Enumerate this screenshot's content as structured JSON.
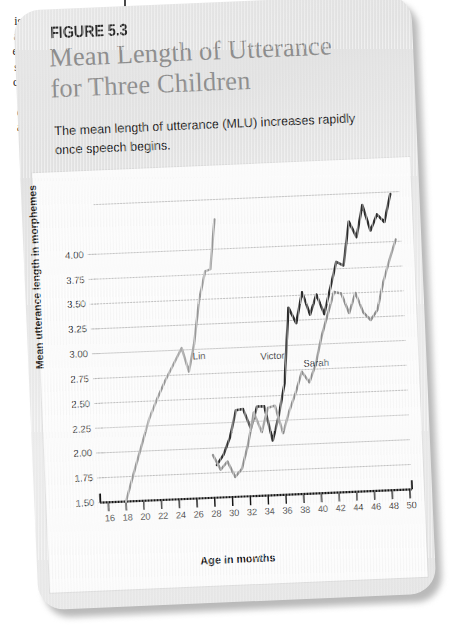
{
  "margin_fragments": [
    "is",
    "at",
    "es",
    "s;",
    "c-",
    "f",
    "e",
    "a"
  ],
  "figure": {
    "number_label": "FIGURE 5.3",
    "title_line1": "Mean Length of Utterance",
    "title_line2": "for Three Children",
    "caption": "The mean length of utterance (MLU) increases rapidly once speech begins."
  },
  "colors": {
    "card_bg": "#e7e7e7",
    "panel_bg": "#fbfbfb",
    "title_gray": "#8e8e8e",
    "gridline": "#b3b3b3",
    "axis_black": "#151515",
    "series_lin": "#9a9a9a",
    "series_victor": "#2b2b2b",
    "series_sarah": "#8e8e8e"
  },
  "chart_data": {
    "type": "line",
    "title": "Mean Length of Utterance for Three Children",
    "xlabel": "Age in months",
    "ylabel": "Mean utterance length in morphemes",
    "xlim": [
      16,
      50
    ],
    "ylim": [
      1.5,
      4.5
    ],
    "xticks": [
      16,
      18,
      20,
      22,
      24,
      26,
      28,
      30,
      32,
      34,
      36,
      38,
      40,
      42,
      44,
      46,
      48,
      50
    ],
    "yticks": [
      1.5,
      1.75,
      2.0,
      2.25,
      2.5,
      2.75,
      3.0,
      3.25,
      3.5,
      3.75,
      4.0
    ],
    "ytick_labels": [
      "1.50",
      "1.75",
      "2.00",
      "2.25",
      "2.50",
      "2.75",
      "3.00",
      "3.25",
      "3.50",
      "3.75",
      "4.00"
    ],
    "grid": true,
    "grid_axis": "y",
    "legend": "inline-labels",
    "annotations": [
      {
        "text": "Lin",
        "x": 26.2,
        "y": 2.93
      },
      {
        "text": "Victor",
        "x": 33.8,
        "y": 2.9
      },
      {
        "text": "Sarah",
        "x": 38.6,
        "y": 2.81
      }
    ],
    "series": [
      {
        "name": "Lin",
        "color": "#9a9a9a",
        "x": [
          18.0,
          19.0,
          20.0,
          21.0,
          22.0,
          23.0,
          24.0,
          25.0,
          25.7,
          26.4,
          27.2,
          28.0,
          28.6,
          29.3
        ],
        "y": [
          1.5,
          1.78,
          2.05,
          2.32,
          2.52,
          2.7,
          2.86,
          3.02,
          2.78,
          3.05,
          3.5,
          3.78,
          3.8,
          4.3
        ]
      },
      {
        "name": "Victor",
        "color": "#2b2b2b",
        "x": [
          28.4,
          29.2,
          30.0,
          30.8,
          31.6,
          32.4,
          33.2,
          34.0,
          34.8,
          35.6,
          36.4,
          37.2,
          38.0,
          38.8,
          39.6,
          40.4,
          41.2,
          42.0,
          42.8,
          43.6,
          44.4,
          45.2,
          46.0,
          46.8,
          47.6,
          48.4,
          49.2
        ],
        "y": [
          1.83,
          1.93,
          2.1,
          2.37,
          2.38,
          2.18,
          2.4,
          2.4,
          2.05,
          2.3,
          2.62,
          3.38,
          3.22,
          3.53,
          3.3,
          3.5,
          3.3,
          3.56,
          3.82,
          3.78,
          4.22,
          4.06,
          4.38,
          4.12,
          4.28,
          4.2,
          4.48
        ]
      },
      {
        "name": "Sarah",
        "color": "#8e8e8e",
        "x": [
          28.0,
          28.8,
          29.6,
          30.4,
          31.2,
          32.0,
          32.8,
          33.6,
          34.4,
          35.2,
          36.0,
          36.8,
          37.6,
          38.4,
          39.2,
          40.0,
          40.8,
          41.6,
          42.4,
          43.2,
          44.0,
          44.8,
          45.6,
          46.4,
          47.2,
          48.0,
          48.8,
          49.6
        ],
        "y": [
          1.93,
          1.78,
          1.86,
          1.7,
          1.78,
          2.02,
          2.34,
          2.14,
          2.38,
          2.4,
          2.12,
          2.34,
          2.52,
          2.73,
          2.62,
          2.8,
          3.08,
          3.3,
          3.52,
          3.5,
          3.3,
          3.5,
          3.3,
          3.22,
          3.32,
          3.6,
          3.82,
          4.02
        ]
      }
    ]
  }
}
